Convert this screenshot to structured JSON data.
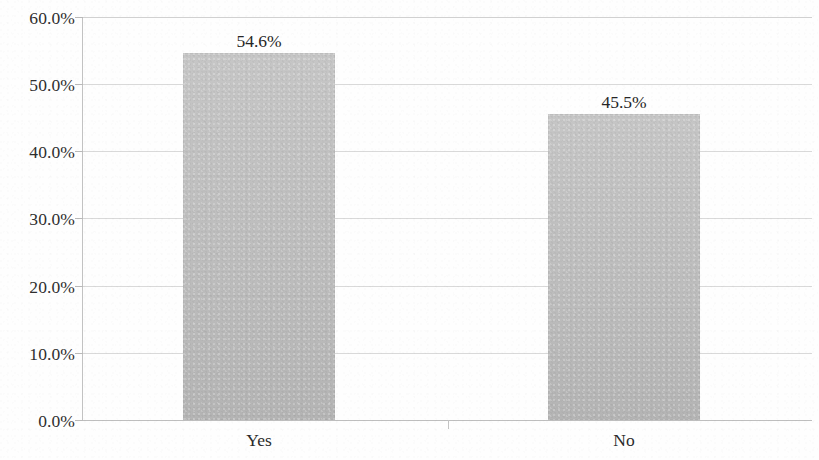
{
  "chart_data": {
    "type": "bar",
    "title": "",
    "subtitle": "",
    "xlabel": "",
    "ylabel": "",
    "categories": [
      "Yes",
      "No"
    ],
    "values": [
      54.6,
      45.5
    ],
    "value_labels": [
      "54.6%",
      "45.5%"
    ],
    "ylim": [
      0,
      60
    ],
    "ytick_values": [
      0,
      10,
      20,
      30,
      40,
      50,
      60
    ],
    "ytick_labels": [
      "0.0%",
      "10.0%",
      "20.0%",
      "30.0%",
      "40.0%",
      "50.0%",
      "60.0%"
    ],
    "grid": true,
    "grid_axis": "y",
    "legend": false,
    "legend_position": "none",
    "bar_color": "#c0c0c0",
    "gridline_color": "#d2d2d2",
    "axis_color": "#c2c2c2",
    "text_color": "#2e2e2e",
    "background_color": "#ffffff"
  },
  "axis": {
    "y_labels": [
      {
        "text": "60.0%",
        "value": 60
      },
      {
        "text": "50.0%",
        "value": 50
      },
      {
        "text": "40.0%",
        "value": 40
      },
      {
        "text": "30.0%",
        "value": 30
      },
      {
        "text": "20.0%",
        "value": 20
      },
      {
        "text": "10.0%",
        "value": 10
      },
      {
        "text": "0.0%",
        "value": 0
      }
    ],
    "x_labels": [
      {
        "text": "Yes"
      },
      {
        "text": "No"
      }
    ]
  },
  "bars": [
    {
      "category": "Yes",
      "value": 54.6,
      "label": "54.6%"
    },
    {
      "category": "No",
      "value": 45.5,
      "label": "45.5%"
    }
  ]
}
